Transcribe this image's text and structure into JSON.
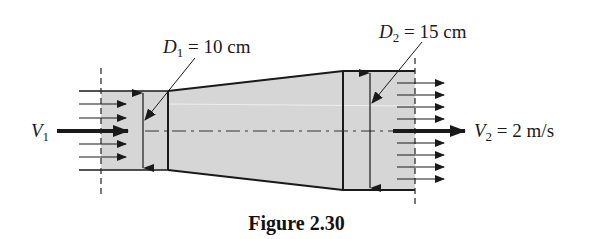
{
  "figure": {
    "caption": "Figure 2.30",
    "labels": {
      "d1": {
        "symbol": "D",
        "subscript": "1",
        "value": " = 10 cm"
      },
      "d2": {
        "symbol": "D",
        "subscript": "2",
        "value": " = 15 cm"
      },
      "v1": {
        "symbol": "V",
        "subscript": "1"
      },
      "v2": {
        "symbol": "V",
        "subscript": "2",
        "value": " = 2 m/s"
      }
    },
    "quantities": {
      "inlet_diameter": "10 cm",
      "outlet_diameter": "15 cm",
      "outlet_velocity": "2 m/s"
    },
    "colors": {
      "fill": "#d6d6d6",
      "line": "#1a1a1a",
      "background": "#ffffff"
    }
  }
}
